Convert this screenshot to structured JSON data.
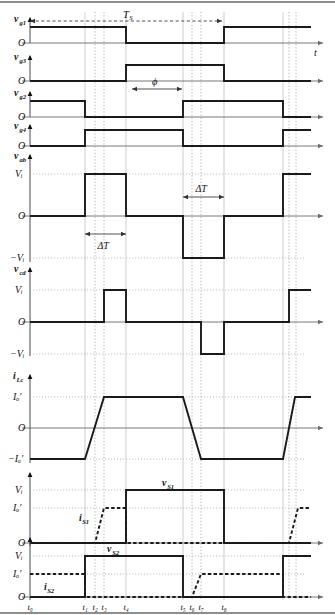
{
  "figure": {
    "type": "timing-waveform-diagram",
    "time_axis_label": "t",
    "period_label": "T_S",
    "phase_label": "ϕ",
    "deadtime_label": "ΔT",
    "zero_label": "O",
    "time_markers": [
      "t0",
      "t1",
      "t2",
      "t3",
      "t4",
      "t5",
      "t6",
      "t7",
      "t8"
    ],
    "time_marker_glyphs": [
      "t₀",
      "t₁",
      "t₂",
      "t₃",
      "t₄",
      "t₅",
      "t₆",
      "t₇",
      "t₈"
    ],
    "colors": {
      "trace": "#1a1a1a",
      "grid": "#b8b8b8",
      "guide": "#c9c9c9",
      "axis": "#555555",
      "background": "#ffffff"
    }
  },
  "traces": [
    {
      "id": "vg1",
      "label": "v",
      "sub": "g1",
      "levels": [
        "O"
      ],
      "kind": "gate",
      "note": "High from t0 to just before t4 region, low, then high again at end of period"
    },
    {
      "id": "vg3",
      "label": "v",
      "sub": "g3",
      "levels": [
        "O"
      ],
      "kind": "gate",
      "note": "Complement of vg1"
    },
    {
      "id": "vg2",
      "label": "v",
      "sub": "g2",
      "levels": [
        "O"
      ],
      "kind": "gate",
      "note": "High at start, falls at t1, rises at t5"
    },
    {
      "id": "vg4",
      "label": "v",
      "sub": "g4",
      "levels": [
        "O"
      ],
      "kind": "gate",
      "note": "Complement of vg2"
    },
    {
      "id": "vab",
      "label": "v",
      "sub": "ab",
      "levels": [
        "Vi",
        "O",
        "-Vi"
      ],
      "level_glyphs": [
        "Vᵢ",
        "O",
        "−Vᵢ"
      ],
      "kind": "three-level",
      "annotation": "ΔT"
    },
    {
      "id": "vcd",
      "label": "v",
      "sub": "cd",
      "levels": [
        "Vi",
        "O",
        "-Vi"
      ],
      "level_glyphs": [
        "Vᵢ",
        "O",
        "−Vᵢ"
      ],
      "kind": "three-level-pulse"
    },
    {
      "id": "iLc",
      "label": "i",
      "sub": "Lc",
      "levels": [
        "Io",
        "O",
        "-Io"
      ],
      "level_glyphs": [
        "Iₒ′",
        "O",
        "−Iₒ′"
      ],
      "kind": "trapezoid"
    },
    {
      "id": "vS1",
      "label": "v",
      "sub": "S1",
      "inline_label": "v",
      "inline_sub": "S1",
      "current_label": "i",
      "current_sub": "S1",
      "levels": [
        "Vi",
        "Io",
        "O"
      ],
      "level_glyphs": [
        "Vᵢ",
        "Iₒ′",
        "O"
      ],
      "kind": "device"
    },
    {
      "id": "vS2",
      "label": "v",
      "sub": "S2",
      "inline_label": "v",
      "inline_sub": "S2",
      "current_label": "i",
      "current_sub": "S2",
      "levels": [
        "Vi",
        "Io",
        "O"
      ],
      "level_glyphs": [
        "Vᵢ",
        "Iₒ′",
        "O"
      ],
      "kind": "device"
    }
  ]
}
